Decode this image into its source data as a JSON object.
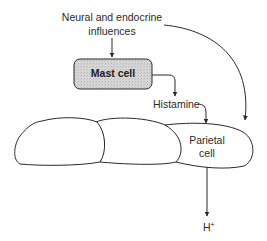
{
  "diagram": {
    "labels": {
      "influences_line1": "Neural and endocrine",
      "influences_line2": "influences",
      "mast_cell": "Mast cell",
      "histamine": "Histamine",
      "parietal_line1": "Parietal",
      "parietal_line2": "cell",
      "h_plus_base": "H",
      "h_plus_sup": "+"
    },
    "colors": {
      "stroke": "#2a2a2a",
      "mast_cell_fill": "#d4d4d4",
      "background": "#ffffff"
    },
    "nodes": [
      {
        "id": "neural-endocrine",
        "label": "Neural and endocrine influences"
      },
      {
        "id": "mast-cell",
        "label": "Mast cell"
      },
      {
        "id": "histamine",
        "label": "Histamine"
      },
      {
        "id": "parietal-cell",
        "label": "Parietal cell"
      },
      {
        "id": "h-plus",
        "label": "H+"
      }
    ],
    "edges": [
      {
        "from": "neural-endocrine",
        "to": "mast-cell"
      },
      {
        "from": "mast-cell",
        "to": "histamine"
      },
      {
        "from": "histamine",
        "to": "parietal-cell"
      },
      {
        "from": "neural-endocrine",
        "to": "parietal-cell"
      },
      {
        "from": "parietal-cell",
        "to": "h-plus"
      }
    ]
  }
}
